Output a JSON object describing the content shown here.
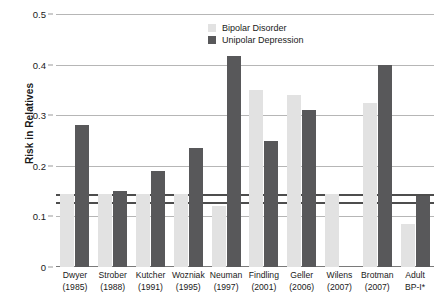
{
  "chart_data": {
    "type": "bar",
    "title": "",
    "xlabel": "",
    "ylabel": "Risk in Relatives",
    "ylim": [
      0,
      0.5
    ],
    "yticks": [
      "0",
      "0.1",
      "0.2",
      "0.3",
      "0.4",
      "0.5"
    ],
    "ytick_values": [
      0,
      0.1,
      0.2,
      0.3,
      0.4,
      0.5
    ],
    "grid": true,
    "legend_position": "top-right",
    "reference_lines": [
      0.145,
      0.128
    ],
    "categories": [
      "Dwyer (1985)",
      "Strober (1988)",
      "Kutcher (1991)",
      "Wozniak (1995)",
      "Neuman (1997)",
      "Findling (2001)",
      "Geller (2006)",
      "Wilens (2007)",
      "Brotman (2007)",
      "Adult BP-I*"
    ],
    "category_lines": [
      [
        "Dwyer",
        "(1985)"
      ],
      [
        "Strober",
        "(1988)"
      ],
      [
        "Kutcher",
        "(1991)"
      ],
      [
        "Wozniak",
        "(1995)"
      ],
      [
        "Neuman",
        "(1997)"
      ],
      [
        "Findling",
        "(2001)"
      ],
      [
        "Geller",
        "(2006)"
      ],
      [
        "Wilens",
        "(2007)"
      ],
      [
        "Brotman",
        "(2007)"
      ],
      [
        "Adult",
        "BP-I*"
      ]
    ],
    "series": [
      {
        "name": "Bipolar Disorder",
        "color": "#e2e2e2",
        "values": [
          0.145,
          0.145,
          0.145,
          0.145,
          0.12,
          0.35,
          0.34,
          0.145,
          0.325,
          0.085
        ]
      },
      {
        "name": "Unipolar Depression",
        "color": "#58585a",
        "values": [
          0.28,
          0.15,
          0.19,
          0.235,
          0.418,
          0.25,
          0.31,
          null,
          0.4,
          0.14
        ]
      }
    ]
  },
  "legend": {
    "items": [
      {
        "label": "Bipolar Disorder",
        "color": "#e2e2e2"
      },
      {
        "label": "Unipolar Depression",
        "color": "#58585a"
      }
    ]
  },
  "axis": {
    "y_title": "Risk in Relatives"
  }
}
